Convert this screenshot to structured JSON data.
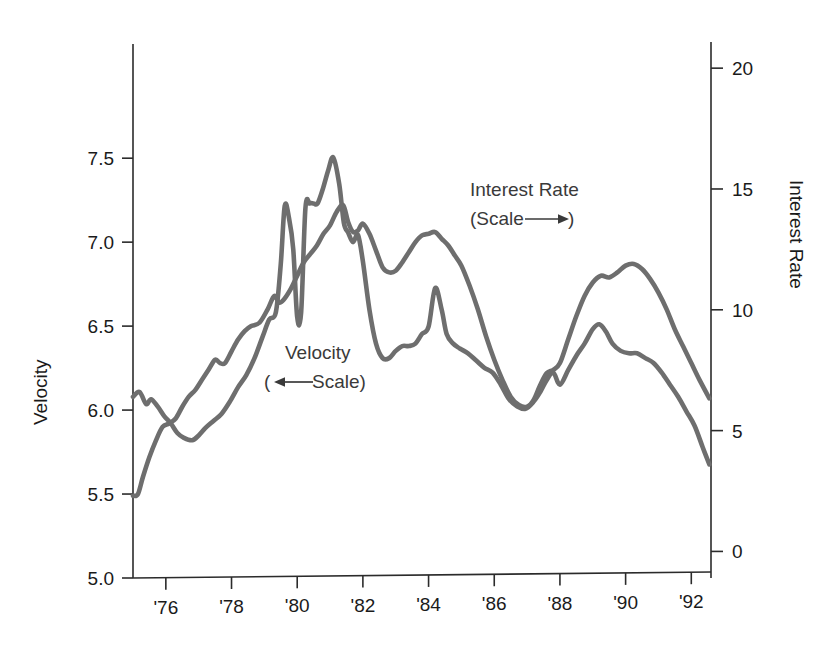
{
  "chart_data": {
    "type": "line",
    "title": "",
    "xlabel": "",
    "grid": false,
    "legend_position": "inline-annotations",
    "x_axis": {
      "tick_labels": [
        "'76",
        "'78",
        "'80",
        "'82",
        "'84",
        "'86",
        "'88",
        "'90",
        "'92"
      ],
      "tick_values": [
        1976,
        1978,
        1980,
        1982,
        1984,
        1986,
        1988,
        1990,
        1992
      ],
      "xlim": [
        1975.0,
        1992.6
      ]
    },
    "y_axis_left": {
      "label": "Velocity",
      "tick_labels": [
        "5.0",
        "5.5",
        "6.0",
        "6.5",
        "7.0",
        "7.5"
      ],
      "tick_values": [
        5.0,
        5.5,
        6.0,
        6.5,
        7.0,
        7.5
      ],
      "ylim": [
        5.0,
        8.18
      ]
    },
    "y_axis_right": {
      "label": "Interest Rate",
      "tick_labels": [
        "0",
        "5",
        "10",
        "15",
        "20"
      ],
      "tick_values": [
        0,
        5,
        10,
        15,
        20
      ],
      "ylim": [
        -1.1,
        21.0
      ]
    },
    "annotations": [
      {
        "name": "interest-rate-annotation",
        "line1": "Interest Rate",
        "line2_pre": "(Scale",
        "line2_post": ")",
        "arrow": "right"
      },
      {
        "name": "velocity-annotation",
        "line1": "Velocity",
        "line2_pre": "(",
        "line2_post": "Scale)",
        "arrow": "left"
      }
    ],
    "series": [
      {
        "name": "Interest Rate",
        "axis": "right",
        "color": "#6e6e6e",
        "x": [
          1975.0,
          1975.2,
          1975.4,
          1975.55,
          1975.75,
          1975.95,
          1976.15,
          1976.35,
          1976.55,
          1976.8,
          1977.0,
          1977.2,
          1977.45,
          1977.7,
          1977.95,
          1978.2,
          1978.45,
          1978.7,
          1978.95,
          1979.15,
          1979.35,
          1979.5,
          1979.62,
          1979.75,
          1979.88,
          1980.0,
          1980.12,
          1980.25,
          1980.38,
          1980.5,
          1980.62,
          1980.78,
          1980.95,
          1981.1,
          1981.28,
          1981.42,
          1981.55,
          1981.7,
          1981.85,
          1982.0,
          1982.2,
          1982.4,
          1982.6,
          1982.8,
          1983.0,
          1983.2,
          1983.4,
          1983.6,
          1983.8,
          1984.0,
          1984.2,
          1984.4,
          1984.55,
          1984.75,
          1984.95,
          1985.2,
          1985.45,
          1985.7,
          1985.95,
          1986.2,
          1986.45,
          1986.7,
          1986.95,
          1987.2,
          1987.4,
          1987.6,
          1987.8,
          1988.0,
          1988.25,
          1988.5,
          1988.75,
          1989.0,
          1989.2,
          1989.4,
          1989.6,
          1989.85,
          1990.1,
          1990.35,
          1990.6,
          1990.85,
          1991.1,
          1991.35,
          1991.6,
          1991.85,
          1992.1,
          1992.35,
          1992.55
        ],
        "y": [
          6.4,
          6.6,
          6.1,
          6.3,
          6.0,
          5.6,
          5.3,
          4.9,
          4.7,
          4.6,
          4.8,
          5.1,
          5.4,
          5.7,
          6.2,
          6.8,
          7.3,
          8.0,
          8.9,
          9.6,
          9.9,
          11.9,
          14.3,
          13.8,
          12.5,
          9.7,
          9.9,
          14.2,
          14.4,
          14.4,
          14.4,
          15.0,
          15.8,
          16.3,
          15.2,
          13.6,
          13.2,
          12.8,
          13.1,
          12.0,
          10.0,
          8.6,
          8.0,
          8.0,
          8.3,
          8.5,
          8.5,
          8.6,
          9.0,
          9.3,
          10.9,
          10.0,
          9.0,
          8.6,
          8.4,
          8.2,
          7.9,
          7.6,
          7.4,
          6.9,
          6.3,
          6.0,
          5.9,
          6.2,
          6.6,
          7.1,
          7.4,
          6.9,
          7.5,
          8.1,
          8.6,
          9.2,
          9.4,
          9.1,
          8.6,
          8.3,
          8.2,
          8.2,
          8.0,
          7.8,
          7.4,
          6.9,
          6.4,
          5.8,
          5.2,
          4.3,
          3.6
        ]
      },
      {
        "name": "Velocity",
        "axis": "left",
        "color": "#6e6e6e",
        "x": [
          1975.0,
          1975.15,
          1975.3,
          1975.5,
          1975.7,
          1975.9,
          1976.1,
          1976.3,
          1976.5,
          1976.7,
          1976.9,
          1977.1,
          1977.3,
          1977.5,
          1977.65,
          1977.8,
          1978.0,
          1978.2,
          1978.4,
          1978.6,
          1978.85,
          1979.1,
          1979.3,
          1979.45,
          1979.6,
          1979.8,
          1980.0,
          1980.2,
          1980.4,
          1980.6,
          1980.8,
          1981.0,
          1981.2,
          1981.4,
          1981.55,
          1981.7,
          1981.85,
          1982.0,
          1982.2,
          1982.4,
          1982.6,
          1982.8,
          1983.0,
          1983.2,
          1983.4,
          1983.6,
          1983.8,
          1984.0,
          1984.2,
          1984.4,
          1984.6,
          1984.8,
          1985.0,
          1985.25,
          1985.5,
          1985.75,
          1986.0,
          1986.25,
          1986.5,
          1986.75,
          1987.0,
          1987.2,
          1987.4,
          1987.6,
          1987.8,
          1988.0,
          1988.25,
          1988.5,
          1988.75,
          1989.0,
          1989.25,
          1989.5,
          1989.75,
          1990.0,
          1990.25,
          1990.5,
          1990.75,
          1991.0,
          1991.25,
          1991.5,
          1991.75,
          1992.0,
          1992.25,
          1992.55
        ],
        "y": [
          5.49,
          5.5,
          5.6,
          5.72,
          5.82,
          5.9,
          5.92,
          5.95,
          6.02,
          6.08,
          6.12,
          6.18,
          6.24,
          6.3,
          6.28,
          6.28,
          6.35,
          6.42,
          6.47,
          6.5,
          6.52,
          6.6,
          6.68,
          6.64,
          6.66,
          6.72,
          6.8,
          6.88,
          6.93,
          6.98,
          7.05,
          7.1,
          7.18,
          7.22,
          7.12,
          7.06,
          7.07,
          7.11,
          7.05,
          6.95,
          6.85,
          6.82,
          6.83,
          6.88,
          6.94,
          7.0,
          7.04,
          7.05,
          7.06,
          7.02,
          6.98,
          6.92,
          6.86,
          6.74,
          6.6,
          6.44,
          6.3,
          6.18,
          6.08,
          6.03,
          6.02,
          6.06,
          6.15,
          6.22,
          6.24,
          6.28,
          6.42,
          6.56,
          6.68,
          6.76,
          6.8,
          6.79,
          6.82,
          6.86,
          6.87,
          6.84,
          6.78,
          6.7,
          6.6,
          6.48,
          6.38,
          6.28,
          6.18,
          6.07
        ]
      }
    ]
  }
}
